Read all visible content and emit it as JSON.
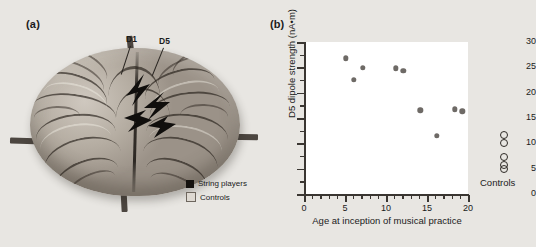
{
  "figure": {
    "background_color": "#e8e6e2"
  },
  "panel_a": {
    "label": "(a)",
    "image_name": "brain-3d-render",
    "annotations": [
      {
        "name": "D1",
        "label": "D1"
      },
      {
        "name": "D5",
        "label": "D5"
      }
    ],
    "legend": {
      "items": [
        {
          "label": "String players",
          "swatch": "filled-black-square",
          "color": "#15120f"
        },
        {
          "label": "Controls",
          "swatch": "open-light-square",
          "color": "#ded9d2"
        }
      ]
    }
  },
  "panel_b": {
    "label": "(b)",
    "controls_group_label": "Controls"
  },
  "chart_data": {
    "type": "scatter",
    "title": "",
    "xlabel": "Age at inception of musical practice",
    "ylabel": "D5 dipole strength (nA•m)",
    "xlim": [
      0,
      20
    ],
    "ylim": [
      0,
      30
    ],
    "xticks": [
      0,
      5,
      10,
      15,
      20
    ],
    "xtick_labels": [
      "0",
      "5",
      "10",
      "15",
      "20"
    ],
    "xminor_step": 1,
    "yticks": [
      0,
      5,
      10,
      15,
      20,
      25,
      30
    ],
    "ytick_labels": [
      "0",
      "5",
      "10",
      "15",
      "20",
      "25",
      "30"
    ],
    "yminor_step": 2.5,
    "grid": false,
    "legend_position": "none",
    "series": [
      {
        "name": "String players",
        "marker": "filled-circle",
        "color": "#6e6a66",
        "points": [
          {
            "x": 5.1,
            "y": 26.8
          },
          {
            "x": 6.1,
            "y": 22.5
          },
          {
            "x": 7.2,
            "y": 24.9
          },
          {
            "x": 11.2,
            "y": 24.8
          },
          {
            "x": 12.1,
            "y": 24.3
          },
          {
            "x": 14.2,
            "y": 16.5
          },
          {
            "x": 16.2,
            "y": 11.5
          },
          {
            "x": 18.4,
            "y": 16.7
          },
          {
            "x": 19.3,
            "y": 16.3
          }
        ]
      },
      {
        "name": "Controls",
        "marker": "open-circle",
        "color": "#2e2a26",
        "x_position": "right-of-axes",
        "values": [
          11.6,
          10.0,
          7.4,
          5.8,
          5.0
        ]
      }
    ]
  }
}
